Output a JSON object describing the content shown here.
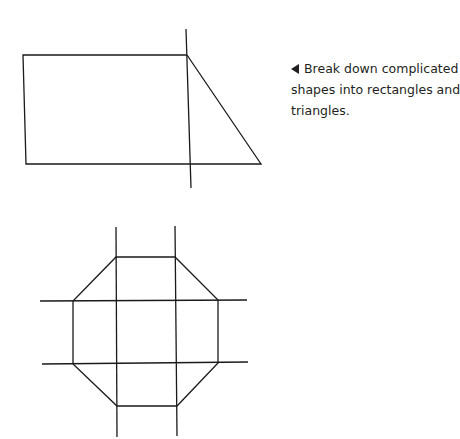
{
  "caption": {
    "arrow_icon": "left-pointing-triangle",
    "text": "Break down complicated shapes into rectangles and triangles."
  },
  "figures": [
    {
      "name": "trapezoid-decomposition",
      "description": "Shape split into a rectangle and a right triangle"
    },
    {
      "name": "octagon-decomposition",
      "description": "Octagon split into rectangles and triangles"
    }
  ]
}
